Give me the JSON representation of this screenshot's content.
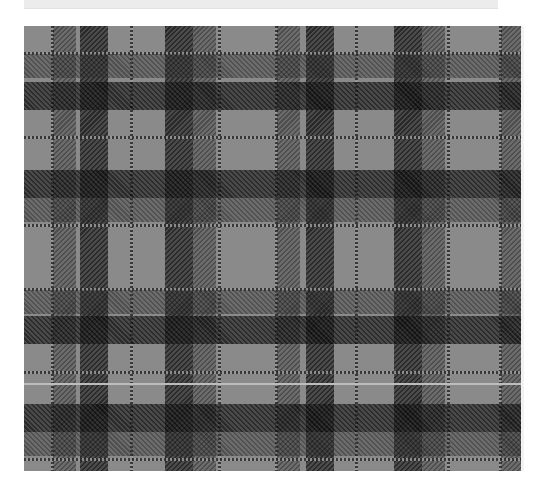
{
  "top_strip": {
    "caption": "· · ·"
  },
  "plaid": {
    "name": "grey-tartan",
    "colors": {
      "ground": "#8a8a8a",
      "medium": "#5e5e5e",
      "dark": "#2f2f2f",
      "darkest": "#111111",
      "line": "#2a2a2a",
      "light_stripe": "#bdbdbd"
    },
    "vertical_bands": [
      {
        "type": "line",
        "x": 27
      },
      {
        "type": "med",
        "x": 29,
        "w": 23
      },
      {
        "type": "dark",
        "x": 56,
        "w": 28
      },
      {
        "type": "line",
        "x": 106
      },
      {
        "type": "dark",
        "x": 141,
        "w": 28
      },
      {
        "type": "med",
        "x": 169,
        "w": 23
      },
      {
        "type": "line",
        "x": 194
      },
      {
        "type": "line",
        "x": 251
      },
      {
        "type": "med",
        "x": 253,
        "w": 23
      },
      {
        "type": "dark",
        "x": 282,
        "w": 28
      },
      {
        "type": "line",
        "x": 331
      },
      {
        "type": "dark",
        "x": 370,
        "w": 28
      },
      {
        "type": "med",
        "x": 398,
        "w": 23
      },
      {
        "type": "line",
        "x": 423
      },
      {
        "type": "line",
        "x": 475
      },
      {
        "type": "med",
        "x": 477,
        "w": 21
      }
    ],
    "horizontal_bands": [
      {
        "type": "line",
        "y": 26
      },
      {
        "type": "med",
        "y": 28,
        "h": 24
      },
      {
        "type": "dark",
        "y": 56,
        "h": 28
      },
      {
        "type": "line",
        "y": 110
      },
      {
        "type": "dark",
        "y": 144,
        "h": 28
      },
      {
        "type": "med",
        "y": 172,
        "h": 24
      },
      {
        "type": "line",
        "y": 198
      },
      {
        "type": "line",
        "y": 262
      },
      {
        "type": "med",
        "y": 264,
        "h": 24
      },
      {
        "type": "dark",
        "y": 290,
        "h": 28
      },
      {
        "type": "line",
        "y": 345
      },
      {
        "type": "dark",
        "y": 378,
        "h": 28
      },
      {
        "type": "med",
        "y": 406,
        "h": 24
      },
      {
        "type": "line",
        "y": 432
      }
    ],
    "light_stripes": [
      {
        "y": 357
      }
    ]
  }
}
